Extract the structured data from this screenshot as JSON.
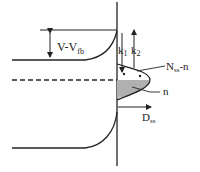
{
  "diagram": {
    "type": "semiconductor band diagram at surface",
    "labels": {
      "v_minus_vfb": {
        "main": "V-V",
        "sub": "fb"
      },
      "k1": {
        "main": "k",
        "sub": "1"
      },
      "k2": {
        "main": "k",
        "sub": "2"
      },
      "nss_minus_n": {
        "main": "N",
        "sub": "ss",
        "suffix": "-n"
      },
      "n": {
        "main": "n"
      },
      "dss": {
        "main": "D",
        "sub": "ss"
      }
    },
    "colors": {
      "line": "#222222",
      "shaded": "#b0b0b0",
      "background": "#ffffff"
    }
  }
}
